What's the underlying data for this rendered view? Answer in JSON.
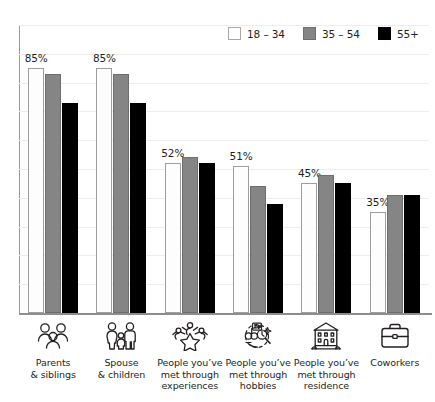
{
  "title": "",
  "legend": {
    "position": "top-right",
    "items": [
      {
        "label": "18 – 34",
        "swatch_color": "#fdfdfd",
        "icon": "legend-swatch-icon"
      },
      {
        "label": "35 – 54",
        "swatch_color": "#858585",
        "icon": "legend-swatch-icon"
      },
      {
        "label": "55+",
        "swatch_color": "#000000",
        "icon": "legend-swatch-icon"
      }
    ]
  },
  "categories_meta": [
    {
      "label": "Parents\n& siblings",
      "line1": "Parents",
      "line2": "& siblings",
      "line3": "",
      "icon": "family-group-icon"
    },
    {
      "label": "Spouse\n& children",
      "line1": "Spouse",
      "line2": "& children",
      "line3": "",
      "icon": "family-parents-child-icon"
    },
    {
      "label": "People you’ve met through experiences",
      "line1": "People you’ve",
      "line2": "met through",
      "line3": "experiences",
      "icon": "people-star-icon"
    },
    {
      "label": "People you’ve met through hobbies",
      "line1": "People you’ve",
      "line2": "met through",
      "line3": "hobbies",
      "icon": "hobbies-icon"
    },
    {
      "label": "People you’ve met through residence",
      "line1": "People you’ve",
      "line2": "met through",
      "line3": "residence",
      "icon": "building-residence-icon"
    },
    {
      "label": "Coworkers",
      "line1": "Coworkers",
      "line2": "",
      "line3": "",
      "icon": "briefcase-icon"
    }
  ],
  "chart_data": {
    "type": "bar",
    "title": "",
    "subtitle": "",
    "xlabel": "",
    "ylabel": "",
    "ylim": [
      0,
      100
    ],
    "grid": true,
    "grid_interval": 10,
    "legend_position": "top-right",
    "value_unit": "%",
    "categories": [
      "Parents & siblings",
      "Spouse & children",
      "People you’ve met through experiences",
      "People you’ve met through hobbies",
      "People you’ve met through residence",
      "Coworkers"
    ],
    "series": [
      {
        "name": "18 – 34",
        "color": "#fdfdfd",
        "values": [
          85,
          85,
          52,
          51,
          45,
          35
        ],
        "labels": [
          "85%",
          "85%",
          "52%",
          "51%",
          "45%",
          "35%"
        ]
      },
      {
        "name": "35 – 54",
        "color": "#858585",
        "values": [
          83,
          83,
          54,
          44,
          48,
          41
        ],
        "labels": [
          "",
          "",
          "",
          "",
          "",
          ""
        ]
      },
      {
        "name": "55+",
        "color": "#000000",
        "values": [
          73,
          73,
          52,
          38,
          45,
          41
        ],
        "labels": [
          "",
          "",
          "",
          "",
          "",
          ""
        ]
      }
    ],
    "annotations": [
      {
        "category": "Parents & siblings",
        "series": "18 – 34",
        "text": "85%"
      },
      {
        "category": "Spouse & children",
        "series": "18 – 34",
        "text": "85%"
      },
      {
        "category": "People you’ve met through experiences",
        "series": "18 – 34",
        "text": "52%"
      },
      {
        "category": "People you’ve met through hobbies",
        "series": "18 – 34",
        "text": "51%"
      },
      {
        "category": "People you’ve met through residence",
        "series": "18 – 34",
        "text": "45%"
      },
      {
        "category": "Coworkers",
        "series": "18 – 34",
        "text": "35%"
      }
    ]
  }
}
